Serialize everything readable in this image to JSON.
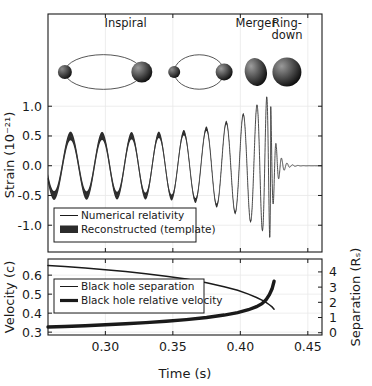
{
  "figure": {
    "background": "#ffffff",
    "ink_color": "#1a1a1a",
    "grid_color": "#e9e9e9"
  },
  "panels": {
    "top": {
      "name": "strain-panel",
      "ylabel": "Strain (10⁻²¹)",
      "yticks": [
        "1.0",
        "0.5",
        "0.0",
        "-0.5",
        "-1.0"
      ],
      "ytick_values": [
        1.0,
        0.5,
        0.0,
        -0.5,
        -1.0
      ],
      "ylim": [
        -1.45,
        2.55
      ],
      "annotations": [
        {
          "label": "Inspiral",
          "x": 0.315
        },
        {
          "label": "Merger",
          "x": 0.4115
        },
        {
          "label": "Ring-",
          "x": 0.4345
        },
        {
          "label": "down",
          "x": 0.4345
        }
      ],
      "legend": [
        {
          "label": "Numerical relativity",
          "style": "thin-line"
        },
        {
          "label": "Reconstructed (template)",
          "style": "thick-band"
        }
      ]
    },
    "bottom": {
      "name": "velocity-separation-panel",
      "ylabel_left": "Velocity (c)",
      "ylabel_right": "Separation (Rₛ)",
      "yticks_left": [
        "0.6",
        "0.5",
        "0.4",
        "0.3"
      ],
      "ytick_values_left": [
        0.6,
        0.5,
        0.4,
        0.3
      ],
      "ylim_left": [
        0.285,
        0.685
      ],
      "yticks_right": [
        "4",
        "3",
        "2",
        "1",
        "0"
      ],
      "ytick_values_right": [
        4,
        3,
        2,
        1,
        0
      ],
      "ylim_right": [
        -0.15,
        4.85
      ],
      "legend": [
        {
          "label": "Black hole separation",
          "style": "thin-line"
        },
        {
          "label": "Black hole relative velocity",
          "style": "thick-line"
        }
      ]
    }
  },
  "xaxis": {
    "label": "Time (s)",
    "ticks": [
      "0.30",
      "0.35",
      "0.40",
      "0.45"
    ],
    "tick_values": [
      0.3,
      0.35,
      0.4,
      0.45
    ],
    "xlim": [
      0.2575,
      0.4605
    ]
  },
  "chart_data": [
    {
      "type": "line",
      "name": "gravitational-wave-strain",
      "title": "",
      "xlabel": "Time (s)",
      "ylabel": "Strain (10^-21)",
      "xlim": [
        0.2575,
        0.4605
      ],
      "ylim": [
        -1.45,
        2.55
      ],
      "grid": true,
      "legend_position": "lower-left",
      "series": [
        {
          "name": "Numerical relativity",
          "style": "thin-line",
          "note": "Chirp waveform: frequency and amplitude rise to merger at t=0.4225 s then ring down.",
          "waveform_model": {
            "t_merge": 0.4225,
            "amp_coeff": 0.175,
            "amp_power": -0.25,
            "freq_coeff": 0.0255,
            "freq_power": -0.375,
            "phase0": 0.62,
            "ringdown_amp": 1.05,
            "ringdown_tau": 0.0038,
            "ringdown_freq_hz": 245
          },
          "peaks_t": [
            0.2592,
            0.2735,
            0.2905,
            0.3065,
            0.3235,
            0.3405,
            0.3575,
            0.3735,
            0.3885,
            0.4005,
            0.4105,
            0.4178,
            0.4225
          ],
          "peaks_y": [
            0.5,
            0.51,
            0.53,
            0.54,
            0.56,
            0.58,
            0.6,
            0.64,
            0.69,
            0.78,
            0.99,
            1.05,
            1.22
          ],
          "troughs_y": [
            -0.52,
            -0.54,
            -0.55,
            -0.57,
            -0.59,
            -0.61,
            -0.64,
            -0.7,
            -0.78,
            -0.9,
            -1.16,
            -1.2,
            -1.1
          ]
        },
        {
          "name": "Reconstructed (template)",
          "style": "thick-band",
          "note": "Grey band of finite thickness around the numerical relativity curve; thins toward merger.",
          "band_halfwidth_start": 0.075,
          "band_halfwidth_end": 0.012
        }
      ]
    },
    {
      "type": "line",
      "name": "velocity-and-separation",
      "title": "",
      "xlabel": "Time (s)",
      "ylabel": "Velocity (c)",
      "ylabel_secondary": "Separation (R_S)",
      "xlim": [
        0.2575,
        0.4605
      ],
      "ylim": [
        0.285,
        0.685
      ],
      "ylim_secondary": [
        -0.15,
        4.85
      ],
      "grid": true,
      "legend_position": "center-left",
      "series": [
        {
          "name": "Black hole separation",
          "axis": "right",
          "units": "R_S",
          "style": "thin-line",
          "x": [
            0.2575,
            0.27,
            0.285,
            0.3,
            0.315,
            0.33,
            0.345,
            0.36,
            0.375,
            0.388,
            0.398,
            0.406,
            0.412,
            0.416,
            0.419,
            0.4215,
            0.4235,
            0.425
          ],
          "y": [
            4.42,
            4.35,
            4.25,
            4.14,
            4.02,
            3.88,
            3.72,
            3.53,
            3.29,
            3.03,
            2.79,
            2.54,
            2.32,
            2.15,
            1.99,
            1.84,
            1.7,
            1.55
          ]
        },
        {
          "name": "Black hole relative velocity",
          "axis": "left",
          "units": "c",
          "style": "thick-line",
          "x": [
            0.2575,
            0.27,
            0.285,
            0.3,
            0.315,
            0.33,
            0.345,
            0.36,
            0.375,
            0.388,
            0.398,
            0.406,
            0.412,
            0.416,
            0.419,
            0.4215,
            0.4235,
            0.425
          ],
          "y": [
            0.327,
            0.33,
            0.334,
            0.339,
            0.344,
            0.35,
            0.357,
            0.366,
            0.377,
            0.39,
            0.403,
            0.418,
            0.434,
            0.45,
            0.47,
            0.497,
            0.528,
            0.568
          ]
        }
      ]
    }
  ],
  "illustration": {
    "name": "black-hole-inspiral-cartoon",
    "stages": [
      {
        "name": "orbit-pair-wide",
        "label": "Inspiral",
        "cx": 0.2985,
        "orbit_rx": 0.0285,
        "orbit_ry": 0.0115,
        "r_left": 7.0,
        "r_right": 10.5
      },
      {
        "name": "orbit-pair-narrow",
        "label": "Inspiral",
        "cx": 0.3695,
        "orbit_rx": 0.0185,
        "orbit_ry": 0.0105,
        "r_left": 6.0,
        "r_right": 8.5
      },
      {
        "name": "merged-blob",
        "label": "Merger",
        "cx": 0.4115,
        "rx": 11.0,
        "ry": 14.0
      },
      {
        "name": "ringdown-sphere",
        "label": "Ring-down",
        "cx": 0.4345,
        "rx": 14.5,
        "ry": 14.5
      }
    ]
  }
}
